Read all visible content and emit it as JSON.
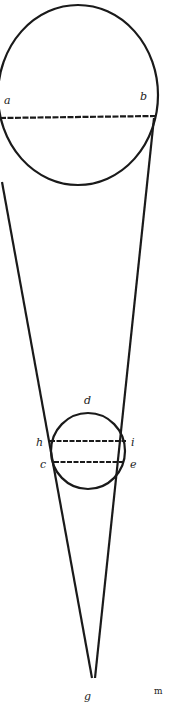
{
  "diagram": {
    "labels": {
      "a": "a",
      "b": "b",
      "d": "d",
      "h": "h",
      "i": "i",
      "c": "c",
      "e": "e",
      "g": "g",
      "corner_mark": "m"
    },
    "colors": {
      "ink": "#1a1a1a",
      "paper": "#ffffff"
    }
  }
}
